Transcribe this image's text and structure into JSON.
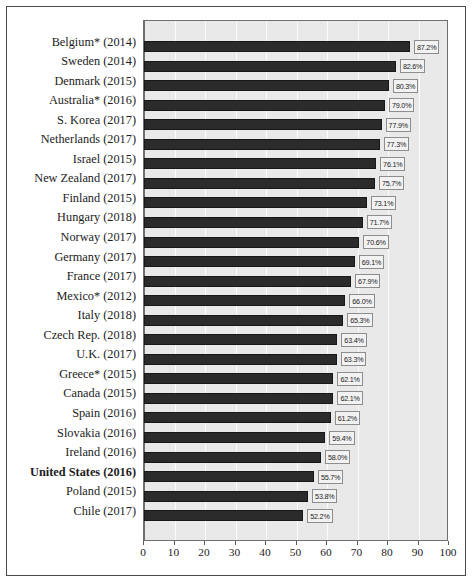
{
  "chart_data": {
    "type": "bar",
    "orientation": "horizontal",
    "title": "",
    "subtitle": "",
    "xlabel": "",
    "ylabel": "",
    "xlim": [
      0,
      100
    ],
    "ylim": null,
    "grid": true,
    "legend": null,
    "value_suffix": "%",
    "xticks": [
      0,
      10,
      20,
      30,
      40,
      50,
      60,
      70,
      80,
      90,
      100
    ],
    "xtick_labels": [
      "0",
      "10",
      "20",
      "30",
      "40",
      "50",
      "60",
      "70",
      "80",
      "90",
      "100"
    ],
    "categories": [
      "Belgium* (2014)",
      "Sweden (2014)",
      "Denmark (2015)",
      "Australia* (2016)",
      "S. Korea (2017)",
      "Netherlands (2017)",
      "Israel (2015)",
      "New Zealand (2017)",
      "Finland (2015)",
      "Hungary (2018)",
      "Norway (2017)",
      "Germany (2017)",
      "France (2017)",
      "Mexico* (2012)",
      "Italy (2018)",
      "Czech Rep. (2018)",
      "U.K. (2017)",
      "Greece* (2015)",
      "Canada (2015)",
      "Spain (2016)",
      "Slovakia (2016)",
      "Ireland (2016)",
      "United States (2016)",
      "Poland (2015)",
      "Chile (2017)"
    ],
    "values": [
      87.2,
      82.6,
      80.3,
      79.0,
      77.9,
      77.3,
      76.1,
      75.7,
      73.1,
      71.7,
      70.6,
      69.1,
      67.9,
      66.0,
      65.3,
      63.4,
      63.3,
      62.1,
      62.1,
      61.2,
      59.4,
      58.0,
      55.7,
      53.8,
      52.2
    ],
    "data_labels": [
      "87.2%",
      "82.6%",
      "80.3%",
      "79.0%",
      "77.9%",
      "77.3%",
      "76.1%",
      "75.7%",
      "73.1%",
      "71.7%",
      "70.6%",
      "69.1%",
      "67.9%",
      "66.0%",
      "65.3%",
      "63.4%",
      "63.3%",
      "62.1%",
      "62.1%",
      "61.2%",
      "59.4%",
      "58.0%",
      "55.7%",
      "53.8%",
      "52.2%"
    ],
    "highlighted_category": "United States (2016)",
    "colors": {
      "bar": "#2b2b2b",
      "bar_edge": "#181818",
      "plot_background": "#e9e9e9",
      "gridline": "#fbfbfb",
      "axis": "#6f6f6f",
      "label_box_background": "#f2f2f2",
      "label_box_border": "#8d8d8d",
      "text": "#1c1c1c",
      "figure_background": "#ffffff",
      "figure_frame": "#4a4a4a"
    }
  }
}
